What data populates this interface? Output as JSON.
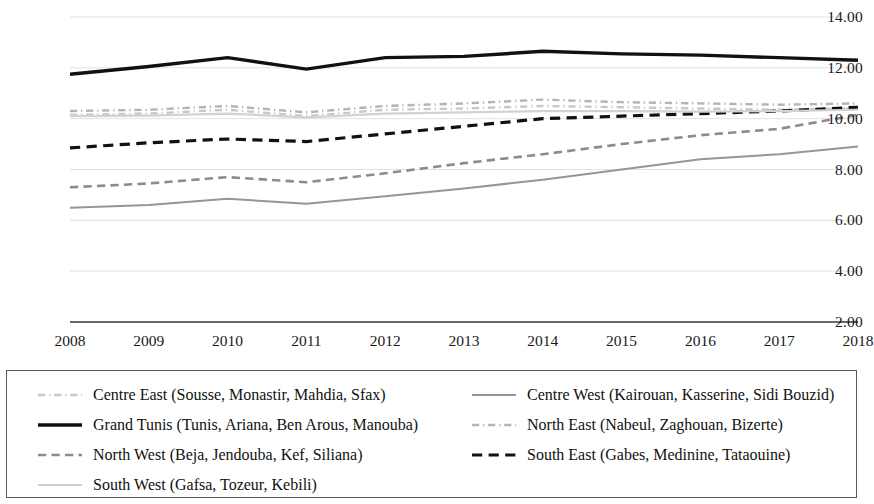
{
  "chart_data": {
    "type": "line",
    "title": "",
    "subtitle": "",
    "xlabel": "",
    "ylabel": "",
    "x": [
      2008,
      2009,
      2010,
      2011,
      2012,
      2013,
      2014,
      2015,
      2016,
      2017,
      2018
    ],
    "xtick_labels": [
      "2008",
      "2009",
      "2010",
      "2011",
      "2012",
      "2013",
      "2014",
      "2015",
      "2016",
      "2017",
      "2018"
    ],
    "ytick_labels": [
      "14.00",
      "12.00",
      "10.00",
      "8.00",
      "6.00",
      "4.00",
      "2.00"
    ],
    "yticks": [
      14,
      12,
      10,
      8,
      6,
      4,
      2
    ],
    "ylim": [
      2,
      14
    ],
    "xlim": [
      2008,
      2018
    ],
    "grid": true,
    "grid_axis": "y",
    "legend_position": "bottom",
    "legend_columns": 2,
    "series": [
      {
        "name": "Centre East (Sousse, Monastir, Mahdia, Sfax)",
        "short_name": "Centre East",
        "style": "dash-dot",
        "color": "#c8c8c8",
        "width": 2.4,
        "values": [
          10.15,
          10.2,
          10.35,
          10.1,
          10.35,
          10.4,
          10.5,
          10.45,
          10.4,
          10.35,
          10.4
        ]
      },
      {
        "name": "Centre West (Kairouan, Kasserine, Sidi Bouzid)",
        "short_name": "Centre West",
        "style": "solid",
        "color": "#969696",
        "width": 2.0,
        "values": [
          6.5,
          6.6,
          6.85,
          6.65,
          6.95,
          7.25,
          7.6,
          8.0,
          8.4,
          8.6,
          8.9
        ]
      },
      {
        "name": "Grand Tunis (Tunis, Ariana, Ben Arous, Manouba)",
        "short_name": "Grand Tunis",
        "style": "solid",
        "color": "#111111",
        "width": 3.4,
        "values": [
          11.75,
          12.05,
          12.4,
          11.95,
          12.4,
          12.45,
          12.65,
          12.55,
          12.5,
          12.4,
          12.3
        ]
      },
      {
        "name": "North East (Nabeul, Zaghouan, Bizerte)",
        "short_name": "North East",
        "style": "dash-dot",
        "color": "#b4b4b4",
        "width": 2.4,
        "values": [
          10.3,
          10.35,
          10.5,
          10.25,
          10.5,
          10.6,
          10.75,
          10.65,
          10.6,
          10.55,
          10.6
        ]
      },
      {
        "name": "North West (Beja, Jendouba, Kef, Siliana)",
        "short_name": "North West",
        "style": "dashed",
        "color": "#8c8c8c",
        "width": 2.6,
        "values": [
          7.3,
          7.45,
          7.7,
          7.5,
          7.85,
          8.25,
          8.6,
          9.0,
          9.35,
          9.6,
          10.15
        ]
      },
      {
        "name": "South East (Gabes, Medinine, Tataouine)",
        "short_name": "South East",
        "style": "dashed",
        "color": "#111111",
        "width": 3.2,
        "values": [
          8.85,
          9.05,
          9.2,
          9.1,
          9.4,
          9.7,
          10.0,
          10.1,
          10.2,
          10.3,
          10.45
        ]
      },
      {
        "name": "South West (Gafsa, Tozeur, Kebili)",
        "short_name": "South West",
        "style": "solid",
        "color": "#d2d2d2",
        "width": 2.2,
        "values": [
          10.1,
          10.12,
          10.2,
          10.05,
          10.2,
          10.25,
          10.3,
          10.3,
          10.28,
          10.3,
          10.35
        ]
      }
    ]
  },
  "legend": {
    "items": [
      {
        "label": "Centre East (Sousse, Monastir, Mahdia, Sfax)",
        "series_index": 0,
        "column": 0,
        "row": 0
      },
      {
        "label": "Centre West (Kairouan, Kasserine, Sidi Bouzid)",
        "series_index": 1,
        "column": 1,
        "row": 0
      },
      {
        "label": "Grand Tunis (Tunis, Ariana, Ben Arous, Manouba)",
        "series_index": 2,
        "column": 0,
        "row": 1
      },
      {
        "label": "North East (Nabeul, Zaghouan, Bizerte)",
        "series_index": 3,
        "column": 1,
        "row": 1
      },
      {
        "label": "North West (Beja, Jendouba, Kef, Siliana)",
        "series_index": 4,
        "column": 0,
        "row": 2
      },
      {
        "label": "South East (Gabes, Medinine, Tataouine)",
        "series_index": 5,
        "column": 1,
        "row": 2
      },
      {
        "label": "South West (Gafsa, Tozeur, Kebili)",
        "series_index": 6,
        "column": 0,
        "row": 3
      }
    ]
  },
  "colors": {
    "axis": "#3c3c3c",
    "grid": "#e2e2e2",
    "text": "#111111",
    "legend_border": "#5a5a5a"
  }
}
